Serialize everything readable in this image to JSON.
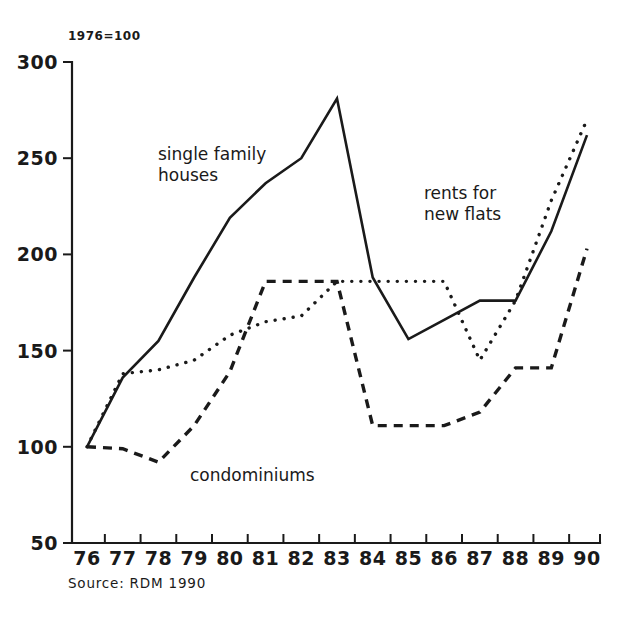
{
  "chart_data": {
    "type": "line",
    "title": "",
    "unit_note": "1976=100",
    "source": "Source: RDM 1990",
    "xlabel": "",
    "ylabel": "",
    "grid": false,
    "legend": "inline-annotations",
    "categories": [
      "76",
      "77",
      "78",
      "79",
      "80",
      "81",
      "82",
      "83",
      "84",
      "85",
      "86",
      "87",
      "88",
      "89",
      "90"
    ],
    "x_tick_labels": [
      "76",
      "77",
      "78",
      "79",
      "80",
      "81",
      "82",
      "83",
      "84",
      "85",
      "86",
      "87",
      "88",
      "89",
      "90"
    ],
    "y_tick_labels": [
      "50",
      "100",
      "150",
      "200",
      "250",
      "300"
    ],
    "y_ticks": [
      50,
      100,
      150,
      200,
      250,
      300
    ],
    "ylim": [
      50,
      300
    ],
    "series": [
      {
        "name": "single family houses",
        "style": "solid",
        "values": [
          100,
          136,
          155,
          188,
          219,
          237,
          250,
          281,
          188,
          156,
          166,
          176,
          176,
          212,
          262
        ]
      },
      {
        "name": "rents for new flats",
        "style": "dotted",
        "values": [
          100,
          138,
          140,
          145,
          158,
          165,
          168,
          186,
          186,
          186,
          186,
          145,
          176,
          228,
          270
        ]
      },
      {
        "name": "condominiums",
        "style": "dashed",
        "values": [
          100,
          99,
          92,
          111,
          139,
          186,
          186,
          186,
          111,
          111,
          111,
          118,
          141,
          141,
          203
        ]
      }
    ],
    "annotations": [
      {
        "text_line1": "single family",
        "text_line2": "houses",
        "series": "single family houses"
      },
      {
        "text_line1": "rents for",
        "text_line2": "new flats",
        "series": "rents for new flats"
      },
      {
        "text_line1": "condominiums",
        "text_line2": "",
        "series": "condominiums"
      }
    ]
  },
  "colors": {
    "ink": "#1a1a1a",
    "background": "#ffffff"
  }
}
